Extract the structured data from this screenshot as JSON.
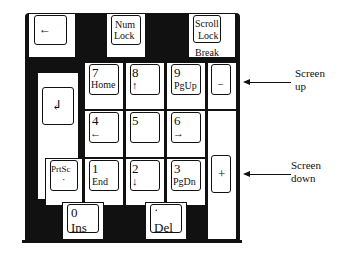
{
  "keys": {
    "backspace": {
      "glyph": "←"
    },
    "numlock": {
      "line1": "Num",
      "line2": "Lock"
    },
    "scrolllock": {
      "line1": "Scroll",
      "line2": "Lock",
      "line3": "Break"
    },
    "enter": {
      "glyph": "↲"
    },
    "k7": {
      "num": "7",
      "sub": "Home"
    },
    "k8": {
      "num": "8",
      "sub": "↑"
    },
    "k9": {
      "num": "9",
      "sub": "PgUp"
    },
    "minus": {
      "label": "–"
    },
    "k4": {
      "num": "4",
      "sub": "←"
    },
    "k5": {
      "num": "5"
    },
    "k6": {
      "num": "6",
      "sub": "→"
    },
    "prtsc": {
      "line1": "PrtSc",
      "line2": "·"
    },
    "k1": {
      "num": "1",
      "sub": "End"
    },
    "k2": {
      "num": "2",
      "sub": "↓"
    },
    "k3": {
      "num": "3",
      "sub": "PgDn"
    },
    "plus": {
      "label": "+"
    },
    "k0": {
      "num": "0",
      "sub": "Ins"
    },
    "dot": {
      "num": "·",
      "sub": "Del"
    }
  },
  "callouts": {
    "screen_up": {
      "line1": "Screen",
      "line2": "up"
    },
    "screen_down": {
      "line1": "Screen",
      "line2": "down"
    }
  }
}
